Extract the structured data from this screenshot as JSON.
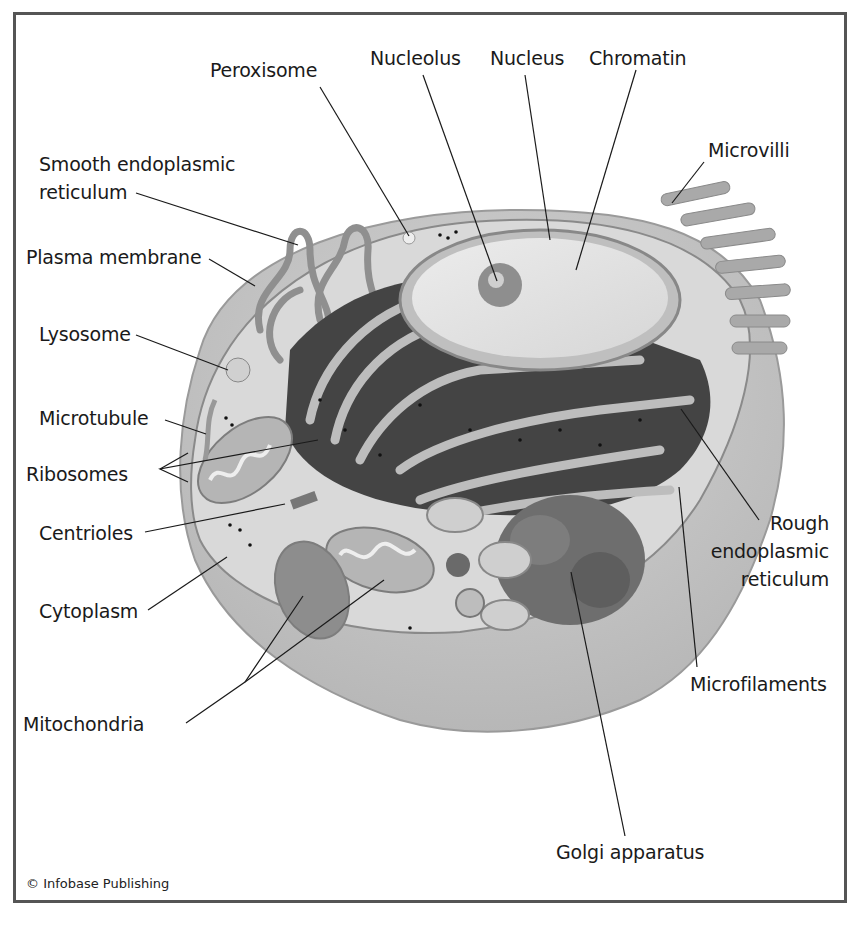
{
  "diagram": {
    "labels": {
      "peroxisome": "Peroxisome",
      "nucleolus": "Nucleolus",
      "nucleus": "Nucleus",
      "chromatin": "Chromatin",
      "microvilli": "Microvilli",
      "smooth_er_1": "Smooth endoplasmic",
      "smooth_er_2": "reticulum",
      "plasma_membrane": "Plasma membrane",
      "lysosome": "Lysosome",
      "microtubule": "Microtubule",
      "ribosomes": "Ribosomes",
      "centrioles": "Centrioles",
      "cytoplasm": "Cytoplasm",
      "mitochondria": "Mitochondria",
      "rough_er_1": "Rough",
      "rough_er_2": "endoplasmic",
      "rough_er_3": "reticulum",
      "microfilaments": "Microfilaments",
      "golgi": "Golgi apparatus"
    },
    "credit": "© Infobase Publishing"
  },
  "colors": {
    "frame": "#555555",
    "cell_body": "#c9c9c9",
    "cytoplasm": "#d9d9d9",
    "nucleus": "#e6e6e6",
    "er_dark": "#3d3d3d",
    "leader_line": "#1a1a1a"
  }
}
